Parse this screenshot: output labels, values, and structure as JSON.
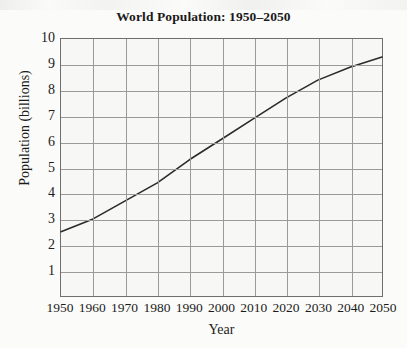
{
  "chart_data": {
    "type": "line",
    "title": "World Population: 1950–2050",
    "xlabel": "Year",
    "ylabel": "Population (billions)",
    "xlim": [
      1950,
      2050
    ],
    "ylim": [
      0,
      10
    ],
    "grid": true,
    "legend": "none",
    "x_ticks": [
      "1950",
      "1960",
      "1970",
      "1980",
      "1990",
      "2000",
      "2010",
      "2020",
      "2030",
      "2040",
      "2050"
    ],
    "y_ticks": [
      "1",
      "2",
      "3",
      "4",
      "5",
      "6",
      "7",
      "8",
      "9",
      "10"
    ],
    "series": [
      {
        "name": "World population",
        "x": [
          1950,
          1960,
          1970,
          1980,
          1990,
          2000,
          2010,
          2020,
          2030,
          2040,
          2050
        ],
        "values": [
          2.5,
          3.0,
          3.7,
          4.4,
          5.3,
          6.1,
          6.9,
          7.7,
          8.4,
          8.9,
          9.3
        ]
      }
    ],
    "colors": {
      "line": "#2b2b2b",
      "grid": "#9a9a9a",
      "axis": "#6f6f6f",
      "plot_background": "#f7f7f5",
      "page_background": "#fbfbf9",
      "text": "#1b1b1b"
    }
  }
}
